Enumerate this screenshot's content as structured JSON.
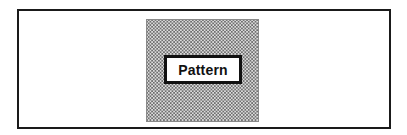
{
  "diagram": {
    "type": "framed-pattern-illustration",
    "label": "Pattern",
    "fill_style": "dotted-ring-texture",
    "colors": {
      "frame": "#1a1a1a",
      "pattern_dots": "#6e6e6e",
      "pattern_background": "#dcdcdc",
      "label_border": "#111111",
      "background": "#ffffff"
    }
  }
}
